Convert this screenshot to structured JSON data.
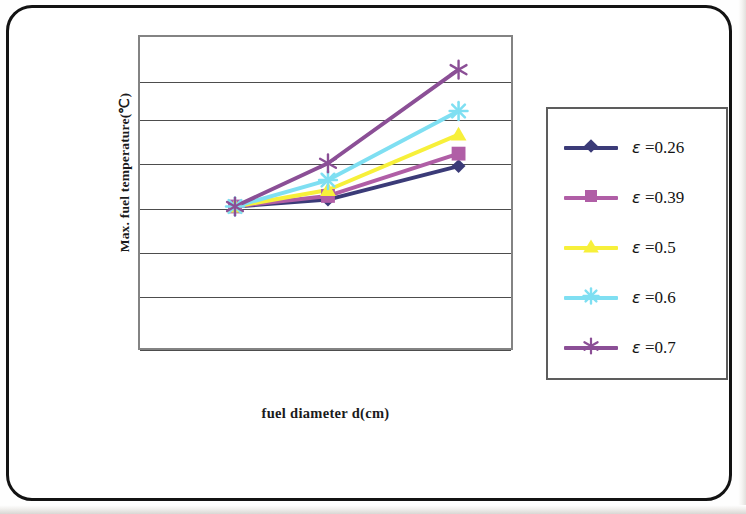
{
  "chart_data": {
    "type": "line",
    "title": "",
    "xlabel": "fuel diameter d(cm)",
    "ylabel": "Max. fuel temperature(℃)",
    "grid": true,
    "legend_position": "right",
    "axis_tick_labels_visible": false,
    "gridline_count": 7,
    "x": [
      1,
      2,
      3
    ],
    "series": [
      {
        "name": "ε =0.26",
        "marker": "diamond",
        "color": "#3b3b78",
        "values": [
          0.455,
          0.477,
          0.585
        ]
      },
      {
        "name": "ε =0.39",
        "marker": "square",
        "color": "#b05ea6",
        "values": [
          0.455,
          0.489,
          0.625
        ]
      },
      {
        "name": "ε =0.5",
        "marker": "triangle",
        "color": "#f7f03a",
        "values": [
          0.455,
          0.508,
          0.686
        ]
      },
      {
        "name": "ε =0.6",
        "marker": "star",
        "color": "#7fdff2",
        "values": [
          0.455,
          0.54,
          0.762
        ]
      },
      {
        "name": "ε =0.7",
        "marker": "asterisk",
        "color": "#8b4f96",
        "values": [
          0.455,
          0.594,
          0.895
        ]
      }
    ]
  },
  "axes": {
    "y_title": "Max. fuel temperature(℃)",
    "x_title": "fuel diameter d(cm)"
  },
  "legend": {
    "items": [
      {
        "label": "ε =0.26",
        "symbol": "ε",
        "value": "=0.26",
        "marker": "diamond-marker",
        "color": "#3b3b78"
      },
      {
        "label": "ε =0.39",
        "symbol": "ε",
        "value": "=0.39",
        "marker": "square-marker",
        "color": "#b05ea6"
      },
      {
        "label": "ε =0.5",
        "symbol": "ε",
        "value": "=0.5",
        "marker": "triangle-marker",
        "color": "#f7f03a"
      },
      {
        "label": "ε =0.6",
        "symbol": "ε",
        "value": "=0.6",
        "marker": "star-marker",
        "color": "#7fdff2"
      },
      {
        "label": "ε =0.7",
        "symbol": "ε",
        "value": "=0.7",
        "marker": "asterisk-marker",
        "color": "#8b4f96"
      }
    ]
  },
  "colors": {
    "frame": "#131313",
    "plot_border": "#838383",
    "gridline": "#4d4d4d",
    "legend_border": "#5d5d5d",
    "text": "#1b1b1b"
  }
}
